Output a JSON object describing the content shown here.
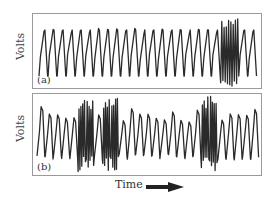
{
  "chart_data": [
    {
      "type": "line",
      "panel_label": "(a)",
      "ylabel": "Volts",
      "xlabel": "Time",
      "description": "Regular sawtooth-like periodic voltage signal with ~24 cycles; a brief high-amplitude burst near 85% of the time axis",
      "cycles": 24,
      "burst_position_fraction": 0.85,
      "grid": false
    },
    {
      "type": "line",
      "panel_label": "(b)",
      "ylabel": "Volts",
      "xlabel": "Time",
      "description": "Irregular oscillating voltage signal with ~27 cycles of varying amplitude; high-amplitude bursts near 20%, 33% and 75% of the time axis",
      "cycles": 27,
      "burst_position_fractions": [
        0.2,
        0.33,
        0.75
      ],
      "grid": false
    }
  ],
  "labels": {
    "ylabel_a": "Volts",
    "ylabel_b": "Volts",
    "panel_a": "(a)",
    "panel_b": "(b)",
    "xlabel": "Time"
  },
  "colors": {
    "trace": "#2a2a2a",
    "frame": "#9a9a9a"
  }
}
